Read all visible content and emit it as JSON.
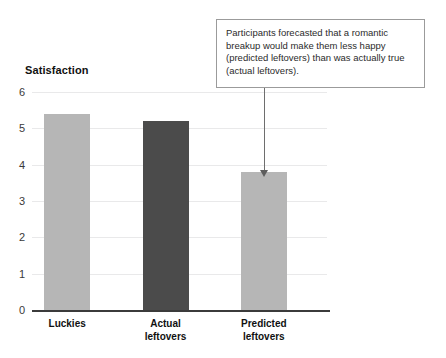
{
  "top_cropped_text": "…",
  "chart_data": {
    "type": "bar",
    "title": "",
    "subtitle": "",
    "xlabel": "",
    "ylabel": "Satisfaction",
    "ylim": [
      0,
      6
    ],
    "yticks": [
      "0",
      "1",
      "2",
      "3",
      "4",
      "5",
      "6"
    ],
    "grid": true,
    "legend": "none",
    "categories": [
      "Luckies",
      "Actual leftovers",
      "Predicted leftovers"
    ],
    "values": [
      5.4,
      5.2,
      3.8
    ],
    "bar_colors": [
      "#b6b6b6",
      "#4b4b4b",
      "#b6b6b6"
    ],
    "category_lines": [
      [
        "Luckies"
      ],
      [
        "Actual",
        "leftovers"
      ],
      [
        "Predicted",
        "leftovers"
      ]
    ],
    "annotations": [
      {
        "text": "Participants forecasted that a romantic breakup would make them less happy (predicted leftovers) than was actually true (actual leftovers).",
        "points_to": "Predicted leftovers",
        "arrow": true
      }
    ]
  },
  "colors": {
    "bar_light": "#b6b6b6",
    "bar_dark": "#4b4b4b",
    "axis": "#3b3b3b",
    "gridline": "#e9e9ea",
    "callout_border": "#9b9b9b",
    "connector": "#6e6e6e",
    "text": "#111111"
  }
}
